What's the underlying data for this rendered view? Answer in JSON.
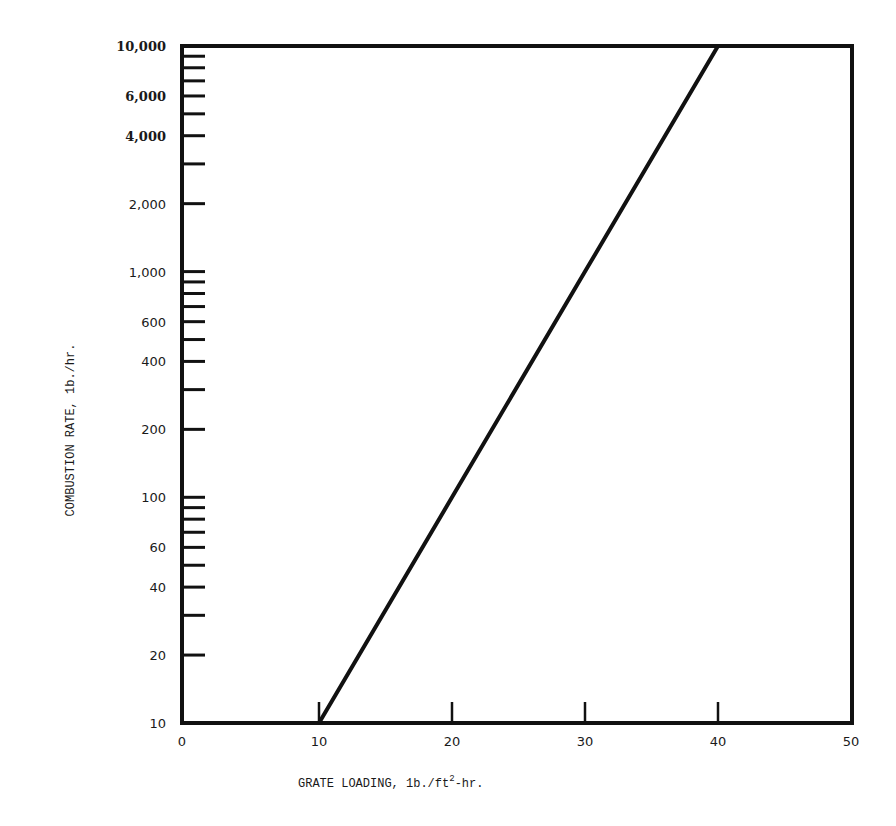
{
  "chart_data": {
    "type": "line",
    "title": "",
    "xlabel": "GRATE LOADING, lb./ft²-hr.",
    "xlabel_parts": {
      "pre": "GRATE LOADING, 1b./ft",
      "sup": "2",
      "post": "-hr."
    },
    "ylabel": "COMBUSTION RATE, 1b./hr.",
    "xlim": [
      0,
      50
    ],
    "ylim": [
      10,
      10000
    ],
    "yscale": "log",
    "grid": false,
    "legend": null,
    "x_ticks": [
      0,
      10,
      20,
      30,
      40,
      50
    ],
    "x_tick_labels": [
      "0",
      "10",
      "20",
      "30",
      "40",
      "50"
    ],
    "x_tick_marks": [
      10,
      20,
      30,
      40
    ],
    "y_tick_labels": [
      {
        "value": 10,
        "label": "10",
        "bold": false
      },
      {
        "value": 20,
        "label": "20",
        "bold": false
      },
      {
        "value": 40,
        "label": "40",
        "bold": false
      },
      {
        "value": 60,
        "label": "60",
        "bold": false
      },
      {
        "value": 100,
        "label": "100",
        "bold": false
      },
      {
        "value": 200,
        "label": "200",
        "bold": false
      },
      {
        "value": 400,
        "label": "400",
        "bold": false
      },
      {
        "value": 600,
        "label": "600",
        "bold": false
      },
      {
        "value": 1000,
        "label": "1,000",
        "bold": false
      },
      {
        "value": 2000,
        "label": "2,000",
        "bold": false
      },
      {
        "value": 4000,
        "label": "4,000",
        "bold": true
      },
      {
        "value": 6000,
        "label": "6,000",
        "bold": true
      },
      {
        "value": 10000,
        "label": "10,000",
        "bold": true
      }
    ],
    "y_tick_marks": [
      20,
      30,
      40,
      50,
      60,
      70,
      80,
      90,
      100,
      200,
      300,
      400,
      500,
      600,
      700,
      800,
      900,
      1000,
      2000,
      3000,
      4000,
      5000,
      6000,
      7000,
      8000,
      9000
    ],
    "series": [
      {
        "name": "Combustion rate vs grate loading",
        "x": [
          10,
          20,
          30,
          40
        ],
        "y": [
          10,
          100,
          1000,
          10000
        ]
      }
    ]
  }
}
